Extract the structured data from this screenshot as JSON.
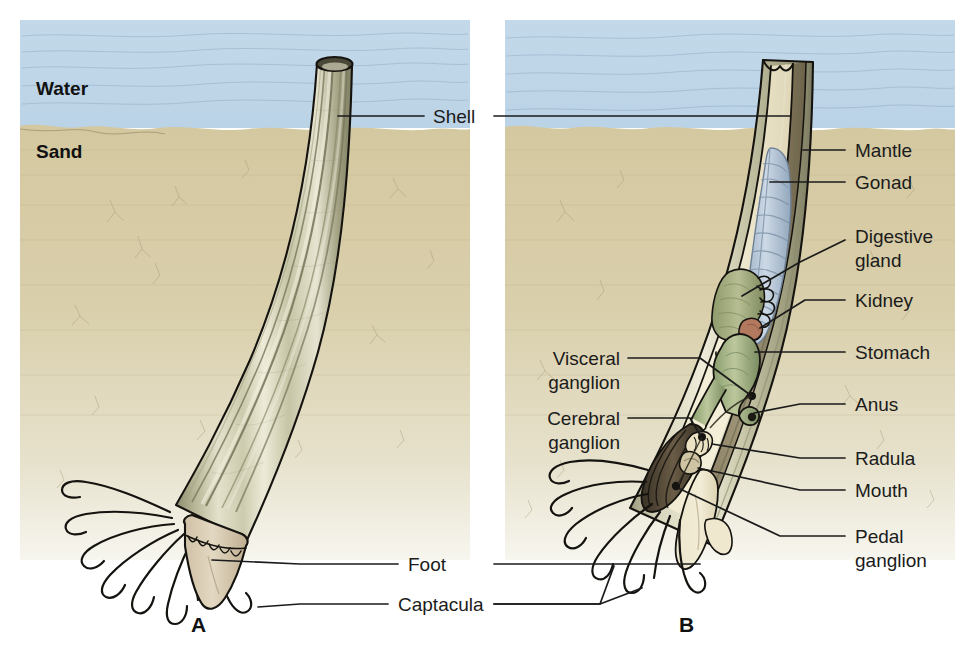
{
  "figure": {
    "title_letters": {
      "a": "A",
      "b": "B"
    },
    "environment": {
      "water_label": "Water",
      "sand_label": "Sand"
    }
  },
  "labels": {
    "shell": "Shell",
    "mantle": "Mantle",
    "gonad": "Gonad",
    "digestive_gland_line1": "Digestive",
    "digestive_gland_line2": "gland",
    "kidney": "Kidney",
    "stomach": "Stomach",
    "anus": "Anus",
    "radula": "Radula",
    "mouth": "Mouth",
    "pedal_ganglion_line1": "Pedal",
    "pedal_ganglion_line2": "ganglion",
    "visceral_ganglion_line1": "Visceral",
    "visceral_ganglion_line2": "ganglion",
    "cerebral_ganglion_line1": "Cerebral",
    "cerebral_ganglion_line2": "ganglion",
    "foot": "Foot",
    "captacula": "Captacula"
  },
  "colors": {
    "water": "#bed6e8",
    "sand": "#d7cca6",
    "sand_lower": "#e4ddc2",
    "shell_light": "#e7e6d2",
    "shell_mid": "#c8c7a8",
    "shell_dark": "#9a9a7c",
    "mantle": "#efe9cf",
    "gonad": "#b8c9da",
    "digestive_gland": "#96a173",
    "kidney": "#b07a63",
    "stomach": "#93a878",
    "foot": "#d8cbb4",
    "outline": "#15130f",
    "text": "#1b1b1b"
  }
}
